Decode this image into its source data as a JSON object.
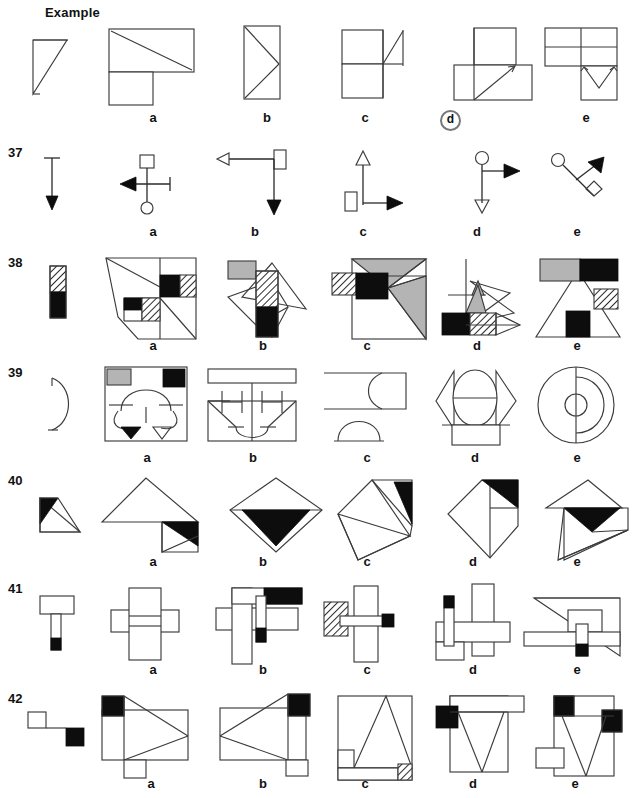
{
  "page": {
    "title": "Example",
    "option_letters": [
      "a",
      "b",
      "c",
      "d",
      "e"
    ],
    "example_marked_answer": "d",
    "colors": {
      "line": "#3b3b3b",
      "black_fill": "#0d0d0d",
      "grey_fill": "#b4b4b4",
      "white_fill": "#ffffff",
      "circle_marker": "#777777",
      "paper": "#ffffff"
    }
  },
  "rows": [
    {
      "number": "",
      "is_example": true,
      "label": "Example",
      "prompt": "right-triangle-with-diagonal",
      "options": [
        {
          "letter": "a",
          "shape": "rectangle-with-diagonal-plus-square-below-left"
        },
        {
          "letter": "b",
          "shape": "tall-rectangle-with-zigzag-diagonals"
        },
        {
          "letter": "c",
          "shape": "two-squares-with-triangle-right"
        },
        {
          "letter": "d",
          "shape": "square-over-rectangle-with-diagonal",
          "marked": true
        },
        {
          "letter": "e",
          "shape": "two-rectangles-over-square-with-vee"
        }
      ]
    },
    {
      "number": "37",
      "is_example": false,
      "prompt": "vertical-arrow-down-with-bar-top",
      "options": [
        {
          "letter": "a",
          "shape": "left-arrow-with-square-top-and-circle-bottom"
        },
        {
          "letter": "b",
          "shape": "left-open-arrow-with-rect-top-and-down-arrow"
        },
        {
          "letter": "c",
          "shape": "up-open-triangle-with-rect-left-and-right-arrow"
        },
        {
          "letter": "d",
          "shape": "circle-top-right-arrow-and-open-down-arrow"
        },
        {
          "letter": "e",
          "shape": "diagonal-circle-to-diamond-with-up-right-arrow"
        }
      ]
    },
    {
      "number": "38",
      "is_example": false,
      "prompt": "vertical-bar-hatched-over-black",
      "options": [
        {
          "letter": "a",
          "shape": "polygon-grid-with-black-and-hatched-squares"
        },
        {
          "letter": "b",
          "shape": "triangles-with-hatched-and-black-bar-plus-grey-rect"
        },
        {
          "letter": "c",
          "shape": "square-with-grey-triangles-black-and-hatched-blocks"
        },
        {
          "letter": "d",
          "shape": "zigzag-with-grey-triangle-black-and-hatched-squares"
        },
        {
          "letter": "e",
          "shape": "triangle-with-grey-black-bar-hatched-square-black-square"
        }
      ]
    },
    {
      "number": "39",
      "is_example": false,
      "prompt": "small-half-circle-open-left",
      "options": [
        {
          "letter": "a",
          "shape": "square-with-arch-grey-and-black-corners-two-triangles"
        },
        {
          "letter": "b",
          "shape": "rect-with-H-shapes-and-curved-vee"
        },
        {
          "letter": "c",
          "shape": "s-curve-with-rectangle-and-half-disc"
        },
        {
          "letter": "d",
          "shape": "circle-between-two-triangles-over-rectangle"
        },
        {
          "letter": "e",
          "shape": "concentric-circles-with-vertical-split"
        }
      ]
    },
    {
      "number": "40",
      "is_example": false,
      "prompt": "triangle-with-black-left-corner",
      "options": [
        {
          "letter": "a",
          "shape": "large-triangle-with-black-wedge-and-small-triangle"
        },
        {
          "letter": "b",
          "shape": "diamond-with-black-inverted-triangle"
        },
        {
          "letter": "c",
          "shape": "folded-triangles-with-black-corner-top-right"
        },
        {
          "letter": "d",
          "shape": "kite-with-black-wedge-top"
        },
        {
          "letter": "e",
          "shape": "triangle-over-triangle-with-black-wedge"
        }
      ]
    },
    {
      "number": "41",
      "is_example": false,
      "prompt": "rectangle-on-stem-with-black-tip",
      "options": [
        {
          "letter": "a",
          "shape": "vertical-bar-crossed-by-horizontal-bars"
        },
        {
          "letter": "b",
          "shape": "cross-bars-with-black-rect-top-right-and-black-tip"
        },
        {
          "letter": "c",
          "shape": "vertical-bar-with-hatched-block-left-and-black-tip-right"
        },
        {
          "letter": "d",
          "shape": "vertical-bars-with-black-tip-and-horizontal-bar"
        },
        {
          "letter": "e",
          "shape": "triangle-with-rect-stem-black-tip-and-long-bar"
        }
      ]
    },
    {
      "number": "42",
      "is_example": false,
      "prompt": "small-white-square-linked-to-black-square",
      "options": [
        {
          "letter": "a",
          "shape": "rect-with-black-corner-top-left-and-bowtie-lines"
        },
        {
          "letter": "b",
          "shape": "rect-with-black-corner-top-right-and-bowtie-lines"
        },
        {
          "letter": "c",
          "shape": "rect-with-tall-triangle-and-hatched-corner"
        },
        {
          "letter": "d",
          "shape": "rect-with-black-square-left-and-vee-lines"
        },
        {
          "letter": "e",
          "shape": "rect-with-two-black-squares-and-vee-lines"
        }
      ]
    }
  ]
}
